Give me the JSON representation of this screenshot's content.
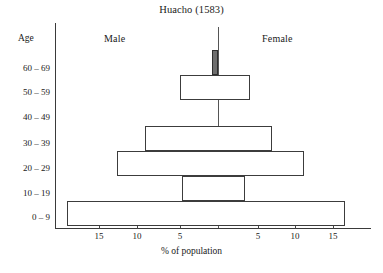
{
  "chart_data": {
    "type": "bar",
    "title": "Huacho (1583)",
    "subtitle": "",
    "xlabel": "% of population",
    "ylabel": "Age",
    "orientation": "population-pyramid",
    "grid": false,
    "legend_position": "top-inline",
    "categories": [
      "0 – 9",
      "10 – 19",
      "20 – 29",
      "30 – 39",
      "40 – 49",
      "50 – 59",
      "60 – 69"
    ],
    "x_tick_labels_left": [
      "15",
      "10",
      "5"
    ],
    "x_tick_labels_right": [
      "5",
      "10",
      "15"
    ],
    "x_tick_values_left": [
      15,
      10,
      5
    ],
    "x_tick_values_right": [
      5,
      10,
      15
    ],
    "xlim": [
      20,
      20
    ],
    "series": [
      {
        "name": "Male",
        "side": "left",
        "values": [
          19.9,
          4.7,
          13.3,
          9.6,
          0.0,
          5.0,
          0.8
        ]
      },
      {
        "name": "Female",
        "side": "right",
        "values": [
          16.7,
          3.6,
          11.4,
          7.1,
          0.0,
          4.2,
          0.0
        ]
      }
    ],
    "annotations": [
      "60–69 male bar is drawn as a narrow shaded (filled) bar adjacent to the centre line"
    ]
  },
  "labels": {
    "title": "Huacho (1583)",
    "male": "Male",
    "female": "Female",
    "age_header": "Age",
    "x_caption": "% of population"
  },
  "axis": {
    "age_ticks": [
      "60 – 69",
      "50 – 59",
      "40 – 49",
      "30 – 39",
      "20 – 29",
      "10 – 19",
      "0 – 9"
    ],
    "x_ticks": [
      "15",
      "10",
      "5",
      "5",
      "10",
      "15"
    ]
  },
  "colors": {
    "line": "#3c3c3c",
    "fill": "#ffffff",
    "shaded_bar": "#6e6e6e",
    "background": "#ffffff",
    "text": "#1a1a1a"
  }
}
